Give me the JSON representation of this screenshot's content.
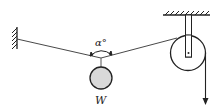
{
  "diagram": {
    "type": "statics-pulley-system",
    "labels": {
      "angle": "α°",
      "weight": "W"
    },
    "components": [
      {
        "name": "left-wall",
        "kind": "fixed-support"
      },
      {
        "name": "ceiling",
        "kind": "fixed-support"
      },
      {
        "name": "rope-left",
        "kind": "rope"
      },
      {
        "name": "rope-right",
        "kind": "rope"
      },
      {
        "name": "weight-ball",
        "kind": "hanging-mass"
      },
      {
        "name": "pulley",
        "kind": "pulley"
      },
      {
        "name": "pull-force-arrow",
        "kind": "force-arrow"
      }
    ],
    "colors": {
      "line": "#222222",
      "ball_fill": "#d9d9d9",
      "background": "#ffffff"
    }
  }
}
